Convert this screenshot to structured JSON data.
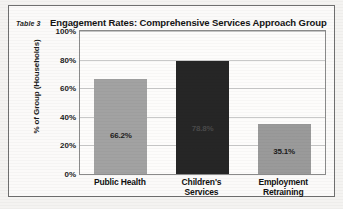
{
  "figure": {
    "table_label": "Table 3",
    "title": "Engagement Rates: Comprehensive Services Approach Group"
  },
  "colors": {
    "bar_light": "#a2a2a2",
    "bar_dark": "#262626",
    "plot_border": "#8a8a8a",
    "gridline": "#c9c9c9",
    "frame_border": "#6f6f6f",
    "page_background": "#f4f3f1",
    "label_dark": "#1c1c1c",
    "label_light": "#d8d8d8"
  },
  "chart_data": {
    "type": "bar",
    "title": "Engagement Rates: Comprehensive Services Approach Group",
    "xlabel": "",
    "ylabel": "% of Group (Households)",
    "ylim": [
      0,
      100
    ],
    "grid": true,
    "legend": "none",
    "categories": [
      "Public Health",
      "Children's Services",
      "Employment Retraining"
    ],
    "category_lines": [
      [
        "Public Health"
      ],
      [
        "Children's",
        "Services"
      ],
      [
        "Employment",
        "Retraining"
      ]
    ],
    "values": [
      66.2,
      78.8,
      35.1
    ],
    "value_labels": [
      "66.2%",
      "78.8%",
      "35.1%"
    ],
    "bar_colors": [
      "#a2a2a2",
      "#262626",
      "#9a9a9a"
    ],
    "label_colors": [
      "#1c1c1c",
      "#4a4a4a",
      "#1c1c1c"
    ],
    "yticks": [
      100,
      80,
      60,
      40,
      20,
      0
    ],
    "ytick_labels": [
      "100%",
      "80%",
      "60%",
      "40%",
      "20%",
      "0%"
    ]
  }
}
